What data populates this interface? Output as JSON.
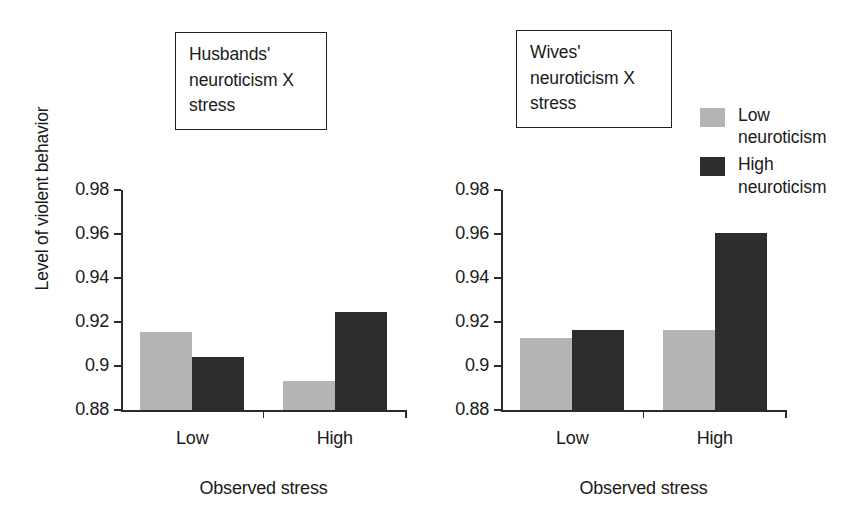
{
  "figure": {
    "y_axis_label": "Level of violent behavior",
    "x_axis_label": "Observed stress",
    "panel_titles": {
      "husbands": "Husbands'\nneuroticism X\nstress",
      "wives": "Wives'\nneuroticism X\nstress"
    }
  },
  "legend": {
    "position": "top-right",
    "items": [
      {
        "label": "Low\nneuroticism",
        "color": "#b4b4b4",
        "series": "Low neuroticism"
      },
      {
        "label": "High\nneuroticism",
        "color": "#2d2d2d",
        "series": "High neuroticism"
      }
    ]
  },
  "axis": {
    "ylim": [
      0.88,
      0.98
    ],
    "ytick_labels": [
      "0.98",
      "0.96",
      "0.94",
      "0.92",
      "0.9",
      "0.88"
    ],
    "ytick_values": [
      0.98,
      0.96,
      0.94,
      0.92,
      0.9,
      0.88
    ],
    "xtick_labels": [
      "Low",
      "High"
    ]
  },
  "colors": {
    "low_neuroticism": "#b4b4b4",
    "high_neuroticism": "#2d2d2d",
    "axis": "#2a2a2a",
    "text": "#1a1a1a",
    "background": "#ffffff"
  },
  "chart_data": [
    {
      "type": "bar",
      "title": "Husbands' neuroticism X stress",
      "panel": "husbands",
      "categories": [
        "Low",
        "High"
      ],
      "xlabel": "Observed stress",
      "ylabel": "Level of violent behavior",
      "ylim": [
        0.88,
        0.98
      ],
      "yticks": [
        0.88,
        0.9,
        0.92,
        0.94,
        0.96,
        0.98
      ],
      "grid": false,
      "legend_position": "top-right",
      "series": [
        {
          "name": "Low neuroticism",
          "color": "#b4b4b4",
          "values": [
            0.9155,
            0.8932
          ]
        },
        {
          "name": "High neuroticism",
          "color": "#2d2d2d",
          "values": [
            0.9041,
            0.9245
          ]
        }
      ]
    },
    {
      "type": "bar",
      "title": "Wives' neuroticism X stress",
      "panel": "wives",
      "categories": [
        "Low",
        "High"
      ],
      "xlabel": "Observed stress",
      "ylabel": "Level of violent behavior",
      "ylim": [
        0.88,
        0.98
      ],
      "yticks": [
        0.88,
        0.9,
        0.92,
        0.94,
        0.96,
        0.98
      ],
      "grid": false,
      "legend_position": "top-right",
      "series": [
        {
          "name": "Low neuroticism",
          "color": "#b4b4b4",
          "values": [
            0.9126,
            0.9162
          ]
        },
        {
          "name": "High neuroticism",
          "color": "#2d2d2d",
          "values": [
            0.9162,
            0.9605
          ]
        }
      ]
    }
  ]
}
